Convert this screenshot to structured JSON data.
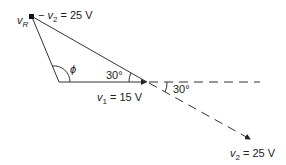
{
  "diagram": {
    "type": "phasor-diagram",
    "labels": {
      "vR": "v",
      "vR_sub": "R",
      "neg_v2_prefix": "− v",
      "neg_v2_sub": "2",
      "neg_v2_value": " = 25 V",
      "phi": "ϕ",
      "angle_top": "30°",
      "angle_right": "30°",
      "v1_prefix": "v",
      "v1_sub": "1",
      "v1_value": " = 15 V",
      "v2_prefix": "v",
      "v2_sub": "2",
      "v2_value": " = 25 V"
    },
    "colors": {
      "line": "#333333",
      "text": "#222222",
      "background": "#ffffff"
    }
  }
}
